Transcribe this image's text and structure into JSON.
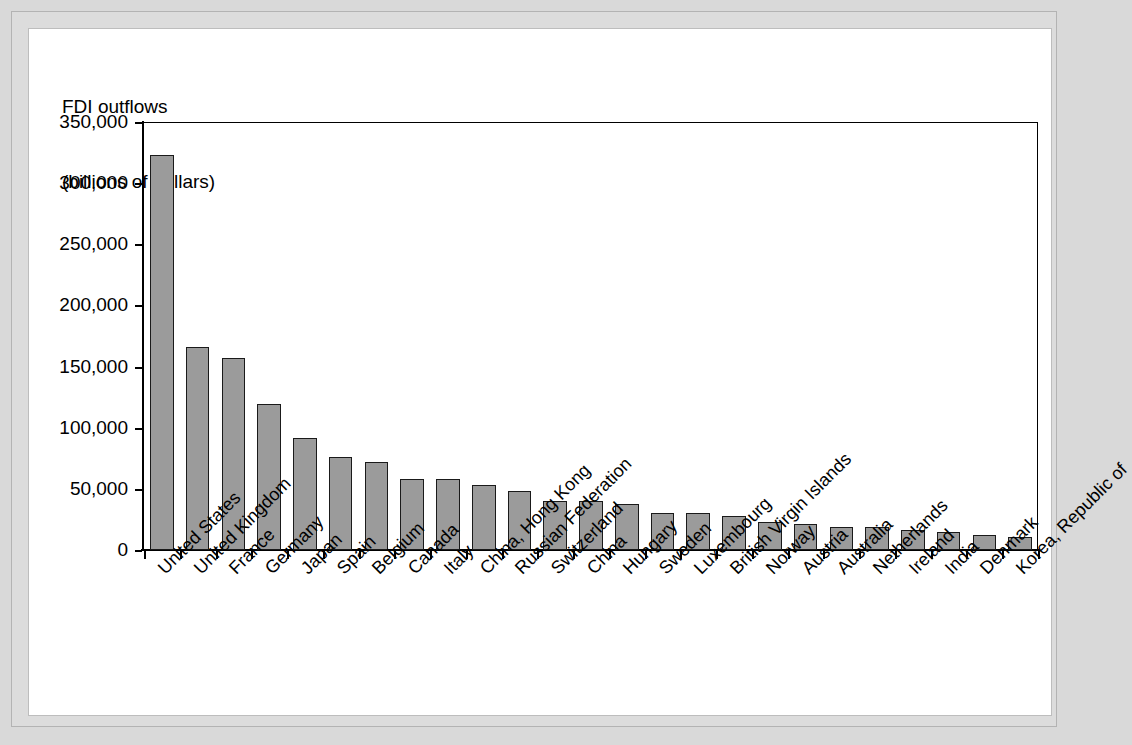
{
  "chart_data": {
    "type": "bar",
    "title": "FDI outflows",
    "subtitle": "(billions of dollars)",
    "xlabel": "",
    "ylabel": "FDI outflows (billions of dollars)",
    "ylim": [
      0,
      350000
    ],
    "ytick_labels": [
      "350,000",
      "300,000",
      "250,000",
      "200,000",
      "150,000",
      "100,000",
      "50,000",
      "0"
    ],
    "ytick_values": [
      350000,
      300000,
      250000,
      200000,
      150000,
      100000,
      50000,
      0
    ],
    "grid": false,
    "legend": "none",
    "categories": [
      "United States",
      "United Kingdom",
      "France",
      "Germany",
      "Japan",
      "Spain",
      "Belgium",
      "Canada",
      "Italy",
      "China, Hong Kong",
      "Russian Federation",
      "Switzerland",
      "China",
      "Hungary",
      "Sweden",
      "Luxembourg",
      "British Virgin Islands",
      "Norway",
      "Austria",
      "Australia",
      "Netherlands",
      "Ireland",
      "India",
      "Denmark",
      "Korea, Republic of"
    ],
    "values": [
      323000,
      166000,
      157000,
      119000,
      92000,
      76000,
      72000,
      58000,
      58000,
      53000,
      48000,
      40000,
      40000,
      38000,
      30000,
      30000,
      28000,
      23000,
      21000,
      19000,
      19000,
      16000,
      15000,
      12000,
      11000
    ],
    "bar_color": "#9b9b9b",
    "bar_border_color": "#1a1a1a",
    "background_color": "#ffffff",
    "frame_color": "#d9d9d9"
  }
}
